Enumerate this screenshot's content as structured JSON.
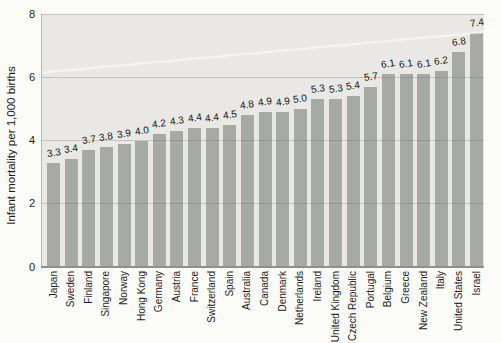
{
  "chart_data": {
    "type": "bar",
    "title": "",
    "xlabel": "",
    "ylabel": "Infant mortality per 1,000 births",
    "ylim": [
      0,
      8
    ],
    "yticks": [
      0,
      2,
      4,
      6,
      8
    ],
    "grid": true,
    "legend": null,
    "categories": [
      "Japan",
      "Sweden",
      "Finland",
      "Singapore",
      "Norway",
      "Hong Kong",
      "Germany",
      "Austria",
      "France",
      "Switzerland",
      "Spain",
      "Australia",
      "Canada",
      "Denmark",
      "Netherlands",
      "Ireland",
      "United Kingdom",
      "Czech Republic",
      "Portugal",
      "Belgium",
      "Greece",
      "New Zealand",
      "Italy",
      "United States",
      "Israel"
    ],
    "values": [
      3.3,
      3.4,
      3.7,
      3.8,
      3.9,
      4.0,
      4.2,
      4.3,
      4.4,
      4.4,
      4.5,
      4.8,
      4.9,
      4.9,
      5.0,
      5.3,
      5.3,
      5.4,
      5.7,
      6.1,
      6.1,
      6.1,
      6.2,
      6.8,
      7.4
    ],
    "value_labels": [
      "3.3",
      "3.4",
      "3.7",
      "3.8",
      "3.9",
      "4.0",
      "4.2",
      "4.3",
      "4.4",
      "4.4",
      "4.5",
      "4.8",
      "4.9",
      "4.9",
      "5.0",
      "5.3",
      "5.3",
      "5.4",
      "5.7",
      "6.1",
      "6.1",
      "6.1",
      "6.2",
      "6.8",
      "7.4"
    ],
    "colors": {
      "bar": "#a7a9a4",
      "plot_background": "#e9e8e4",
      "page_background": "#fbfbf8",
      "axis_line": "#8f8f8c",
      "text": "#1c1c1c"
    }
  }
}
